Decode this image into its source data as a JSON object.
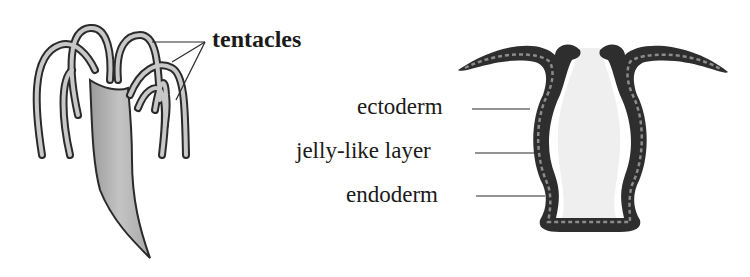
{
  "diagram": {
    "left_figure": {
      "name": "hydra",
      "labels": [
        {
          "id": "tentacles",
          "text": "tentacles"
        }
      ]
    },
    "right_figure": {
      "name": "hydra-cross-section",
      "labels": [
        {
          "id": "ectoderm",
          "text": "ectoderm"
        },
        {
          "id": "jelly",
          "text": "jelly-like layer"
        },
        {
          "id": "endoderm",
          "text": "endoderm"
        }
      ]
    },
    "colors": {
      "outline": "#2a2a2a",
      "body_fill": "#b8b8b8",
      "tentacle_fill": "#c8c8c8",
      "cavity_fill": "#efefef",
      "wall_dark": "#2e2e2e",
      "wall_cells": "#8c8c8c"
    }
  }
}
